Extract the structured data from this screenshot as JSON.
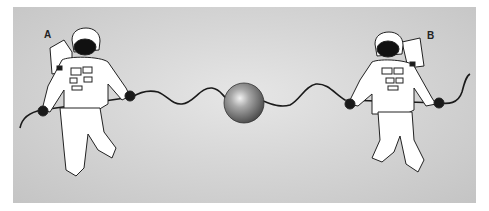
{
  "diagram": {
    "labels": {
      "left_astronaut": "A",
      "right_astronaut": "B"
    },
    "elements": [
      "astronaut-a",
      "astronaut-b",
      "rope",
      "sphere"
    ],
    "colors": {
      "background": "#d0d0d0",
      "suit": "#ffffff",
      "outline": "#222222",
      "visor": "#111111",
      "sphere": "#777777"
    }
  }
}
